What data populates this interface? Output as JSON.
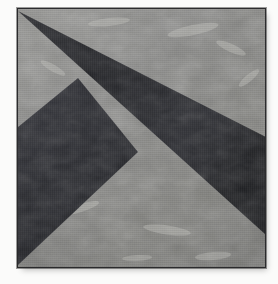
{
  "artwork": {
    "title": "Geometric quilt block",
    "description": "Square fabric block: mottled light grey ground with two dark navy pieced shapes - a long slender triangle sweeping from the upper-left corner to the right edge, and a chevron/arrow shape filling the lower left.",
    "medium": "pieced fabric / quilt block photograph",
    "canvas": {
      "width": 278,
      "height": 284,
      "paper_color": "#fbfbfa"
    },
    "block": {
      "x": 17,
      "y": 8,
      "width": 249,
      "height": 260,
      "border_color": "#2c2c2e"
    },
    "palette": {
      "ground_light": "#8b8b89",
      "ground_mid": "#7e7e7c",
      "ground_highlight": "#b4b4b1",
      "ground_shadow": "#6a6a68",
      "shape_dark": "#242528",
      "shape_dark_alt": "#303136",
      "shape_dark_highlight": "#3d3e44",
      "paper": "#fbfbfa"
    },
    "shapes": [
      {
        "name": "background-ground",
        "kind": "square",
        "fill": "#8b8b89",
        "points": "0,0 249,0 249,260 0,260"
      },
      {
        "name": "long-triangle",
        "kind": "triangle",
        "fill": "#242528",
        "points": "2,4 249,128 249,226",
        "note": "slender spike from the top-left corner fanning out to the right edge"
      },
      {
        "name": "chevron-shape",
        "kind": "quadrilateral",
        "fill": "#2b2c30",
        "points": "61,70 1,119 1,257 121,144",
        "note": "arrow / chevron occupying the lower-left quadrant"
      }
    ]
  }
}
